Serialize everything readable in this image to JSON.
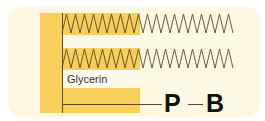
{
  "diagram": {
    "backbone_label": "Glycerin",
    "head_groups": [
      {
        "symbol": "P"
      },
      {
        "symbol": "B"
      }
    ],
    "chains": [
      {
        "name": "fatty-acid-chain-1"
      },
      {
        "name": "fatty-acid-chain-2"
      }
    ],
    "colors": {
      "panel": "#fdf8e2",
      "glycerin": "#f7cf5a",
      "line": "#5a4a2a",
      "text": "#111111"
    }
  }
}
